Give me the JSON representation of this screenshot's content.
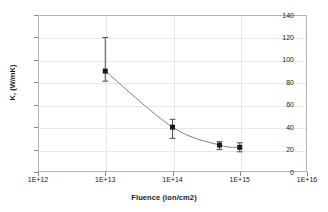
{
  "chart_data": {
    "type": "scatter",
    "title": "",
    "xlabel": "Fluence (ion/cm2)",
    "ylabel": "K, (W/mK)",
    "xscale": "log",
    "yscale": "linear",
    "xlim": [
      1000000000000.0,
      1e+16
    ],
    "ylim": [
      0,
      140
    ],
    "grid": true,
    "legend": false,
    "x_tick_labels": [
      "1E+12",
      "1E+13",
      "1E+14",
      "1E+15",
      "1E+16"
    ],
    "x_tick_values": [
      1000000000000.0,
      10000000000000.0,
      100000000000000.0,
      1000000000000000.0,
      1e+16
    ],
    "y_tick_labels": [
      "0",
      "20",
      "40",
      "60",
      "80",
      "100",
      "120",
      "140"
    ],
    "y_tick_values": [
      0,
      20,
      40,
      60,
      80,
      100,
      120,
      140
    ],
    "series": [
      {
        "name": "thermal conductivity",
        "marker": "filled-square",
        "marker_color": "#1a1a1a",
        "line_color": "#808080",
        "x": [
          10000000000000.0,
          100000000000000.0,
          500000000000000.0,
          1000000000000000.0
        ],
        "y": [
          90,
          40,
          24,
          22
        ],
        "yerr_upper": [
          30,
          7,
          3,
          4
        ],
        "yerr_lower": [
          9,
          10,
          4,
          4
        ]
      }
    ],
    "colors": {
      "plot_background": "#ffffff",
      "gridline": "#e8e8e8",
      "axis_border": "#b3b3b3",
      "tick_mark": "#888888",
      "text": "#1a1a1a",
      "curve": "#808080",
      "marker": "#1a1a1a",
      "errorbar": "#4d4d4d"
    }
  }
}
